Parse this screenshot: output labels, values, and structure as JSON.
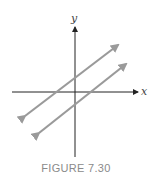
{
  "figure": {
    "caption": "FIGURE 7.30",
    "x_axis_label": "x",
    "y_axis_label": "y",
    "axis_color": "#222222",
    "line_color": "#9a9a9a",
    "lines": [
      {
        "name": "upper-line",
        "description": "line with positive slope and positive y-intercept"
      },
      {
        "name": "lower-line",
        "description": "parallel line with positive slope and negative y-intercept"
      }
    ]
  }
}
